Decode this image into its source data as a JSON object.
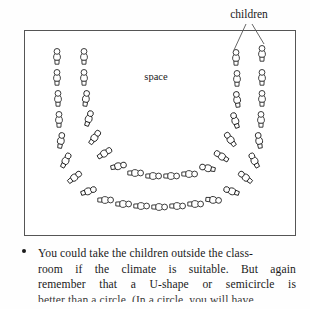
{
  "figure": {
    "name": "classroom-u-shape-seating-diagram",
    "room_border_color": "#555555",
    "figure_stroke_color": "#1a1a1a",
    "labels": {
      "children": "children",
      "space": "space"
    },
    "arrangement": {
      "shape": "U-shape",
      "rows": 2,
      "description": "Two concentric U-shaped arcs of seated children facing inward around an open central space"
    },
    "outer_arc_children": 22,
    "inner_arc_children": 18
  },
  "body": {
    "bullet": "•",
    "lines": [
      {
        "left": "You could take the children outside the class-",
        "justified": false
      },
      {
        "left": "room if the climate is suitable. But again",
        "justified": true,
        "words": [
          "room",
          "if",
          "the",
          "climate",
          "is",
          "suitable.",
          "But",
          "again"
        ]
      },
      {
        "left": "remember that a U-shape or semicircle is",
        "justified": true,
        "words": [
          "remember",
          "that",
          "a",
          "U-shape",
          "or",
          "semicircle",
          "is"
        ]
      },
      {
        "left": "better than a circle. (In a circle, you will have",
        "justified": false
      }
    ]
  }
}
